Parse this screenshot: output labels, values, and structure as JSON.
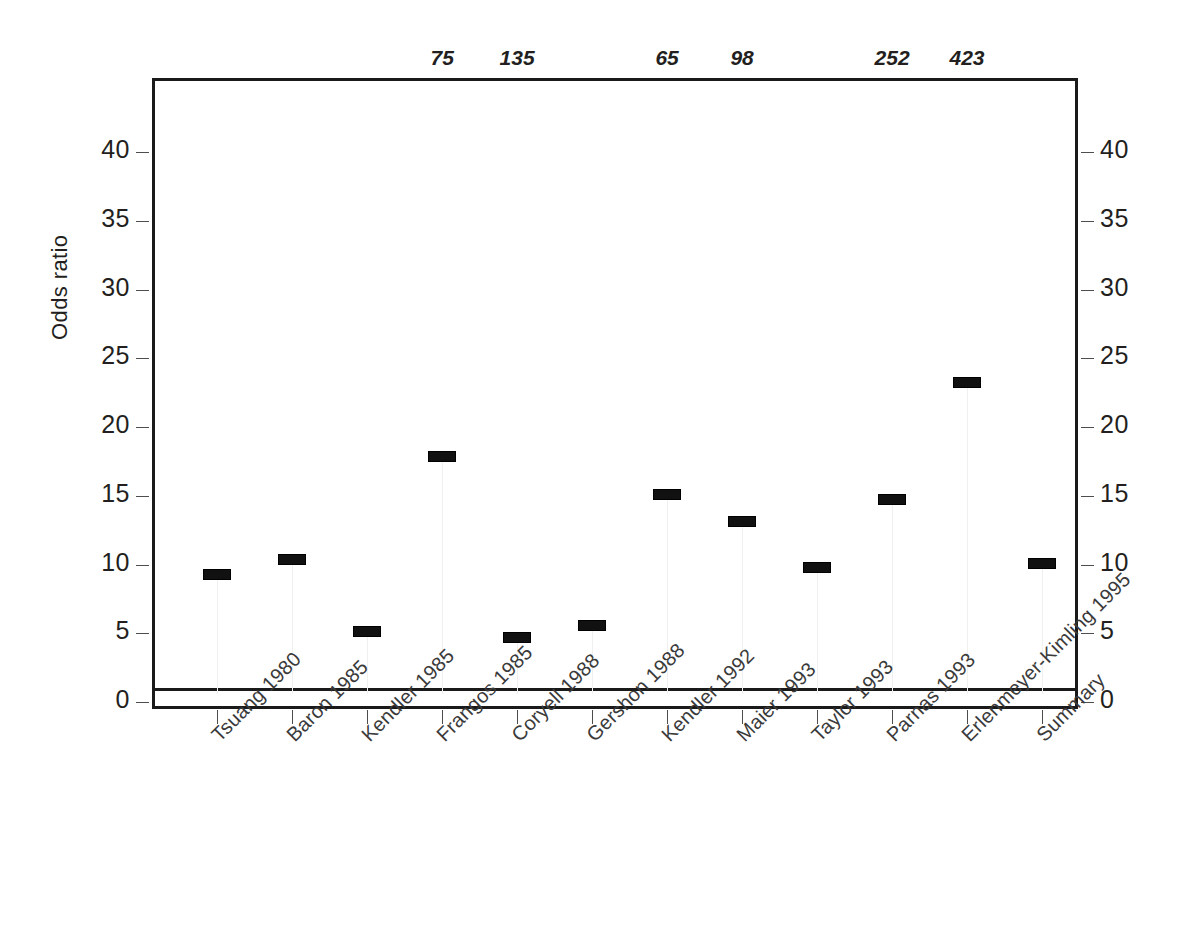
{
  "chart_data": {
    "type": "scatter",
    "title": "",
    "subtitle": "",
    "xlabel": "",
    "ylabel": "Odds ratio",
    "ylim": [
      0,
      44
    ],
    "yticks": [
      0,
      5,
      10,
      15,
      20,
      25,
      30,
      35,
      40
    ],
    "ytick_labels": [
      "0",
      "5",
      "10",
      "15",
      "20",
      "25",
      "30",
      "35",
      "40"
    ],
    "grid": false,
    "legend": "none",
    "dual_y_axis": true,
    "reference_line": {
      "value": 1,
      "label": "",
      "style": "solid"
    },
    "categories": [
      "Tsuang 1980",
      "Baron 1985",
      "Kendler 1985",
      "Frangos 1985",
      "Coryell 1988",
      "Gershon 1988",
      "Kendler 1992",
      "Maier 1993",
      "Taylor 1993",
      "Parnas 1993",
      "Erlenmeyer-Kimling 1995",
      "Summary"
    ],
    "values": [
      9.3,
      10.4,
      5.2,
      17.9,
      4.7,
      5.6,
      15.1,
      13.2,
      9.8,
      14.8,
      23.3,
      10.1
    ],
    "top_annotations": [
      "",
      "",
      "",
      "75",
      "135",
      "",
      "65",
      "98",
      "",
      "252",
      "423",
      ""
    ],
    "marker_style": "filled-rectangle"
  },
  "axes": {
    "left": {
      "title": "Odds ratio",
      "ticks": [
        "40",
        "35",
        "30",
        "25",
        "20",
        "15",
        "10",
        "5",
        "0"
      ]
    },
    "right": {
      "ticks": [
        "40",
        "35",
        "30",
        "25",
        "20",
        "15",
        "10",
        "5",
        "0"
      ]
    }
  }
}
